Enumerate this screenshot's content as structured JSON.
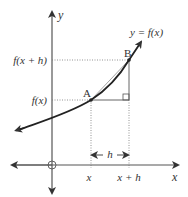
{
  "diagram": {
    "axes": {
      "x_label": "x",
      "y_label": "y",
      "origin_marker": "circle"
    },
    "curve_label": "y = f(x)",
    "points": [
      {
        "name": "A",
        "x_label": "x",
        "y_label": "f(x)"
      },
      {
        "name": "B",
        "x_label": "x + h",
        "y_label": "f(x + h)"
      }
    ],
    "interval_label": "h",
    "right_angle_marker": true,
    "colors": {
      "curve": "#222222",
      "axes": "#444444",
      "guides": "#666666",
      "chord": "#999999"
    }
  }
}
